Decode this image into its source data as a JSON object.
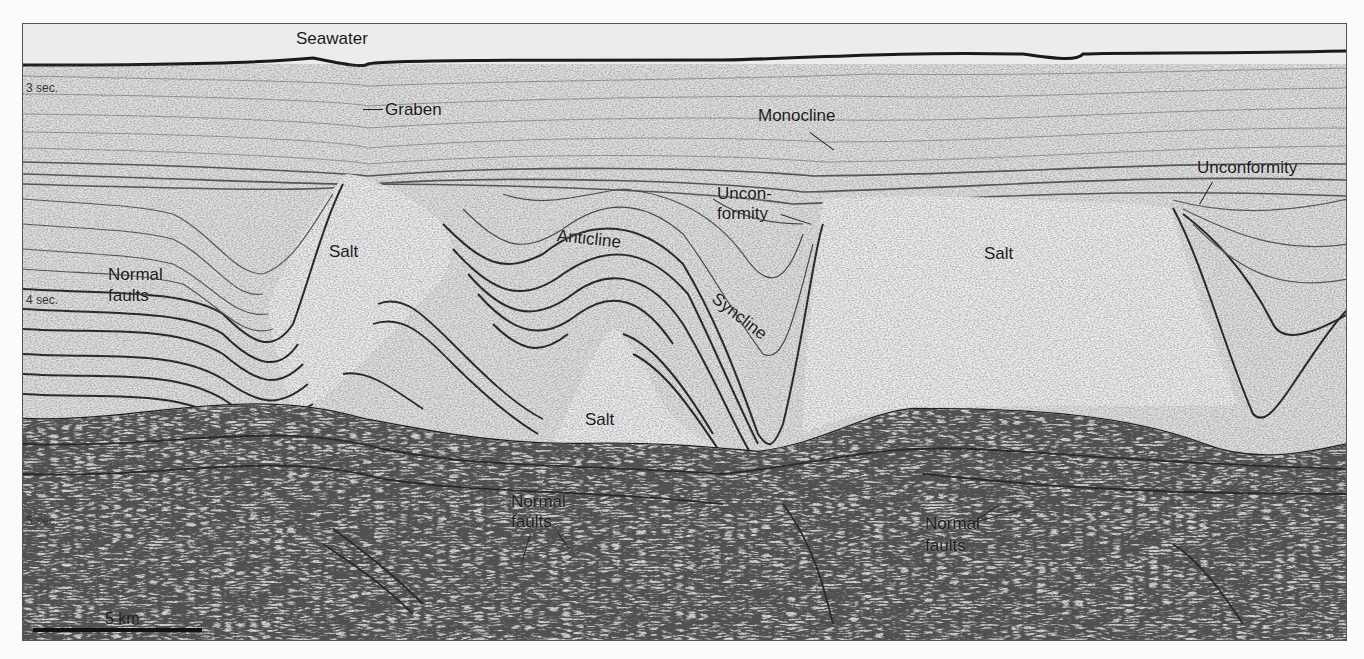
{
  "figure": {
    "colors": {
      "background": "#e6e6e6",
      "reflector": "#1c1c1c",
      "salt": "#efefef",
      "frame": "#555555"
    }
  },
  "time_axis": {
    "ticks": [
      {
        "label": "3 sec.",
        "y": 64
      },
      {
        "label": "4 sec.",
        "y": 276
      },
      {
        "label": "5 sec.",
        "y": 497
      }
    ]
  },
  "scale_bar": {
    "label": "5 km"
  },
  "labels": {
    "seawater": "Seawater",
    "graben": "Graben",
    "monocline": "Monocline",
    "unconformity_mid_line1": "Uncon-",
    "unconformity_mid_line2": "formity",
    "unconformity_right": "Unconformity",
    "salt_left": "Salt",
    "salt_center": "Salt",
    "salt_right": "Salt",
    "anticline": "Anticline",
    "syncline": "Syncline",
    "normal_faults_left_line1": "Normal",
    "normal_faults_left_line2": "faults",
    "normal_faults_center_line1": "Normal",
    "normal_faults_center_line2": "faults",
    "normal_faults_right_line1": "Normal",
    "normal_faults_right_line2": "faults"
  }
}
